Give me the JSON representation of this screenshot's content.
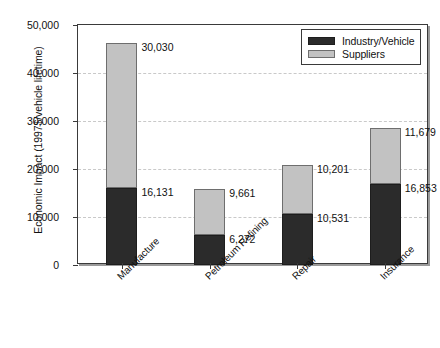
{
  "chart_data": {
    "type": "bar",
    "subtype": "stacked-vertical",
    "title": "",
    "xlabel": "",
    "ylabel": "Economic Impact (1997$/vehicle lifetime)",
    "categories": [
      "Manufacture",
      "Petroleum Refining",
      "Repair",
      "Insurance"
    ],
    "series": [
      {
        "name": "Industry/Vehicle",
        "color": "#2b2b2b",
        "values": [
          16131,
          6272,
          10531,
          16853
        ],
        "labels": [
          "16,131",
          "6,272",
          "10,531",
          "16,853"
        ]
      },
      {
        "name": "Suppliers",
        "color": "#c2c2c2",
        "values": [
          30030,
          9661,
          10201,
          11679
        ],
        "labels": [
          "30,030",
          "9,661",
          "10,201",
          "11,679"
        ]
      }
    ],
    "totals": [
      46161,
      15933,
      20732,
      28532
    ],
    "ylim": [
      0,
      50000
    ],
    "ytick_values": [
      0,
      10000,
      20000,
      30000,
      40000,
      50000
    ],
    "ytick_labels": [
      "0",
      "10,000",
      "20,000",
      "30,000",
      "40,000",
      "50,000"
    ],
    "grid": "horizontal-dashed",
    "legend_position": "top-right-inside",
    "xtick_label_rotation": -45
  },
  "legend": {
    "items": [
      {
        "label": "Industry/Vehicle",
        "color": "#2b2b2b"
      },
      {
        "label": "Suppliers",
        "color": "#c2c2c2"
      }
    ]
  },
  "colors": {
    "industry_vehicle": "#2b2b2b",
    "suppliers": "#c2c2c2",
    "axis": "#3a3a3a",
    "gridline": "#c9c9c9",
    "background": "#ffffff"
  }
}
